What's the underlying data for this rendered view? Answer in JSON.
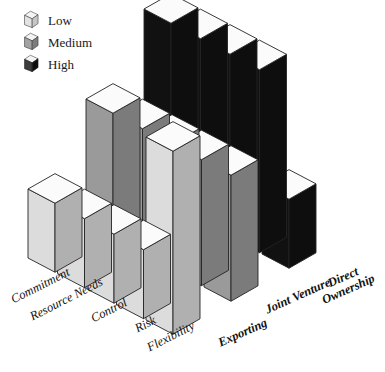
{
  "figure": {
    "background_color": "#ffffff",
    "title": ""
  },
  "legend": {
    "position": "top-left",
    "items": [
      {
        "label": "Low",
        "icon": "cube-icon",
        "top_color": "#f2f2f2",
        "left_color": "#dcdcdc",
        "right_color": "#bfbfbf"
      },
      {
        "label": "Medium",
        "icon": "cube-icon",
        "top_color": "#f2f2f2",
        "left_color": "#9a9a9a",
        "right_color": "#808080"
      },
      {
        "label": "High",
        "icon": "cube-icon",
        "top_color": "#f2f2f2",
        "left_color": "#3a3a3a",
        "right_color": "#111111"
      }
    ]
  },
  "axis_left": {
    "name": "criteria",
    "labels": [
      "Commitment",
      "Resource Needs",
      "Control",
      "Risk",
      "Flexibility"
    ]
  },
  "axis_right": {
    "name": "entry-mode",
    "labels": [
      "Exporting",
      "Joint Venture",
      "Direct Ownership"
    ]
  },
  "chart_data": {
    "type": "bar",
    "title": "",
    "xlabel": "",
    "ylabel": "",
    "zlabel": "",
    "projection": "3d-isometric",
    "grid": false,
    "legend_position": "top-left",
    "categories": [
      "Commitment",
      "Resource Needs",
      "Control",
      "Risk",
      "Flexibility"
    ],
    "level_scale": {
      "Low": 1,
      "Medium": 2,
      "High": 3
    },
    "ylim": [
      0,
      3
    ],
    "series": [
      {
        "name": "Exporting",
        "shade": "Low",
        "color": "#dcdcdc",
        "levels": [
          "Low",
          "Low",
          "Low",
          "Low",
          "High"
        ],
        "values": [
          1,
          1,
          1,
          1,
          3
        ]
      },
      {
        "name": "Joint Venture",
        "shade": "Medium",
        "color": "#9a9a9a",
        "levels": [
          "Medium",
          "Medium",
          "Medium",
          "Medium",
          "Medium"
        ],
        "values": [
          2,
          2,
          2,
          2,
          2
        ]
      },
      {
        "name": "Direct Ownership",
        "shade": "High",
        "color": "#111111",
        "levels": [
          "High",
          "High",
          "High",
          "High",
          "Low"
        ],
        "values": [
          3,
          3,
          3,
          3,
          1
        ]
      }
    ],
    "annotations": [
      "Taller bar = higher level of the criterion for that market entry mode",
      "Flexibility is inverted: highest for Exporting, lowest for Direct Ownership"
    ]
  }
}
